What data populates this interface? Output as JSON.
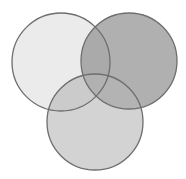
{
  "diagram": {
    "type": "venn",
    "sets": 3,
    "circles": [
      {
        "id": "left",
        "cx": 61,
        "cy": 62,
        "r": 49,
        "fill": "#e8e8e8",
        "opacity": 0.85
      },
      {
        "id": "right",
        "cx": 129,
        "cy": 61,
        "r": 48,
        "fill": "#8f8f8f",
        "opacity": 0.7
      },
      {
        "id": "bottom",
        "cx": 95,
        "cy": 122,
        "r": 48,
        "fill": "#b5b5b5",
        "opacity": 0.6
      }
    ],
    "stroke": "#6e6e6e"
  }
}
